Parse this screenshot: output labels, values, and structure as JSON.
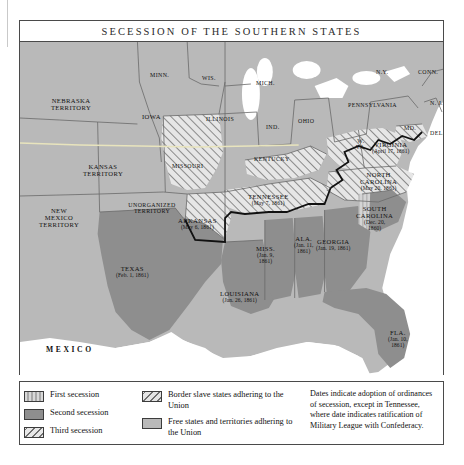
{
  "map": {
    "title": "Secession of the Southern States",
    "colors": {
      "first_secession": "#c6c6c6",
      "second_secession": "#8e8e8e",
      "third_secession": "#e8e8e8",
      "border_slave": "#e4e4e4",
      "free_states": "#b9b9b9",
      "water": "#ffffff",
      "border_line": "#4a4a4a"
    },
    "labels": [
      {
        "name": "NEBRASKA",
        "line2": "TERRITORY",
        "x": 52,
        "y": 62,
        "cls": "wrap"
      },
      {
        "name": "IOWA",
        "line2": "",
        "x": 140,
        "y": 78,
        "cls": ""
      },
      {
        "name": "MINN.",
        "line2": "",
        "x": 147,
        "y": 38,
        "cls": "sm"
      },
      {
        "name": "WIS.",
        "line2": "",
        "x": 196,
        "y": 40,
        "cls": "sm"
      },
      {
        "name": "MICH.",
        "line2": "",
        "x": 251,
        "y": 45,
        "cls": "sm"
      },
      {
        "name": "N.Y.",
        "line2": "",
        "x": 368,
        "y": 36,
        "cls": "sm"
      },
      {
        "name": "CONN.",
        "line2": "",
        "x": 418,
        "y": 37,
        "cls": "sm"
      },
      {
        "name": "PENNSYLVANIA",
        "line2": "",
        "x": 360,
        "y": 68,
        "cls": "sm"
      },
      {
        "name": "N. J.",
        "line2": "",
        "x": 424,
        "y": 66,
        "cls": "sm"
      },
      {
        "name": "MD.",
        "line2": "",
        "x": 398,
        "y": 92,
        "cls": "sm"
      },
      {
        "name": "DEL.",
        "line2": "",
        "x": 425,
        "y": 97,
        "cls": "sm"
      },
      {
        "name": "OHIO",
        "line2": "",
        "x": 295,
        "y": 84,
        "cls": "sm"
      },
      {
        "name": "IND.",
        "line2": "",
        "x": 258,
        "y": 90,
        "cls": "sm"
      },
      {
        "name": "ILLINOIS",
        "line2": "",
        "x": 211,
        "y": 82,
        "cls": "sm"
      },
      {
        "name": "KANSAS",
        "line2": "TERRITORY",
        "x": 83,
        "y": 128,
        "cls": "wrap"
      },
      {
        "name": "MISSOURI",
        "line2": "",
        "x": 173,
        "y": 129,
        "cls": "sm"
      },
      {
        "name": "KENTUCKY",
        "line2": "",
        "x": 258,
        "y": 122,
        "cls": "sm"
      },
      {
        "name": "W.",
        "line2": "VA.",
        "x": 342,
        "y": 103,
        "cls": "wrap sm"
      },
      {
        "name": "NEW",
        "line2": "MEXICO",
        "x": 39,
        "y": 176,
        "cls": "wrap"
      },
      {
        "name": "UNORGANIZED",
        "line2": "TERRITORY",
        "x": 131,
        "y": 168,
        "cls": "wrap sm"
      }
    ],
    "dated_labels": [
      {
        "name": "VIRGINIA",
        "date": "(April 17, 1861)",
        "x": 383,
        "y": 108
      },
      {
        "name": "NORTH",
        "date": "CAROLINA|(May 20, 1861)",
        "x": 366,
        "y": 143
      },
      {
        "name": "SOUTH",
        "date": "CAROLINA|(Dec. 20,|1860)",
        "x": 358,
        "y": 180
      },
      {
        "name": "TENNESSEE",
        "date": "(May 7, 1861)",
        "x": 256,
        "y": 161
      },
      {
        "name": "ARKANSAS",
        "date": "(May 6, 1861)",
        "x": 186,
        "y": 184
      },
      {
        "name": "GEORGIA",
        "date": "(Jan. 19, 1861)",
        "x": 322,
        "y": 205
      },
      {
        "name": "ALA.",
        "date": "(Jan. 11,|1861)",
        "x": 288,
        "y": 202
      },
      {
        "name": "MISS.",
        "date": "(Jan. 9,|1861)",
        "x": 248,
        "y": 212
      },
      {
        "name": "LOUISIANA",
        "date": "(Jan. 26, 1861)",
        "x": 228,
        "y": 257
      },
      {
        "name": "TEXAS",
        "date": "(Feb. 1, 1861)",
        "x": 118,
        "y": 232
      },
      {
        "name": "FLA.",
        "date": "(Jan. 10,|1861)",
        "x": 382,
        "y": 296
      }
    ],
    "region_label": "MEXICO",
    "territory_extra": "TERRITORY"
  },
  "legend": {
    "items_left": [
      {
        "label": "First secession",
        "swatch": "sw-first"
      },
      {
        "label": "Second secession",
        "swatch": "sw-second"
      },
      {
        "label": "Third secession",
        "swatch": "sw-third"
      }
    ],
    "items_mid": [
      {
        "label": "Border slave states adhering to the Union",
        "swatch": "sw-border"
      },
      {
        "label": "Free states and territories adhering to the Union",
        "swatch": "sw-free"
      }
    ],
    "note": "Dates indicate adoption of ordinances of secession, except in Tennessee, where date indicates ratification of Military League with Confederacy."
  }
}
